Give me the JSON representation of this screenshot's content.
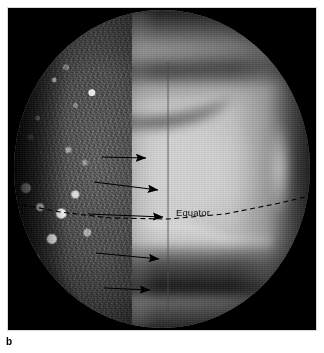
{
  "figure": {
    "panel_label": "b",
    "caption_text": "",
    "background_color": "#ffffff",
    "frame_color": "#000000"
  },
  "image": {
    "subject": "planetary-disk",
    "description": "Telescopic image of a banded planetary disk with a mottled terminator hemisphere at left and bright cloud zones at right",
    "annotations": {
      "equator_label": "Equator",
      "equator_line_style": "dashed",
      "meridian_line_style": "solid-thin",
      "arrow_count": 5,
      "arrow_color": "#000000"
    }
  },
  "arrows": [
    {
      "id": "arrow-1",
      "x1": 102,
      "y1": 157,
      "x2": 146,
      "y2": 158
    },
    {
      "id": "arrow-2",
      "x1": 94,
      "y1": 182,
      "x2": 158,
      "y2": 190
    },
    {
      "id": "arrow-3",
      "x1": 88,
      "y1": 214,
      "x2": 163,
      "y2": 217
    },
    {
      "id": "arrow-4",
      "x1": 96,
      "y1": 253,
      "x2": 159,
      "y2": 259
    },
    {
      "id": "arrow-5",
      "x1": 104,
      "y1": 288,
      "x2": 150,
      "y2": 290
    }
  ],
  "equator_curve": {
    "points": "14,203 60,212 110,218 168,219 225,214 280,203 305,197"
  },
  "meridian": {
    "x": 168,
    "y1": 62,
    "y2": 320
  },
  "equator_label_pos": {
    "x": 176,
    "y": 207
  },
  "colors": {
    "disk_bright": "#d4d4d4",
    "disk_mid": "#8f8f8f",
    "disk_dark": "#2a2a2a",
    "black": "#000000",
    "white": "#ffffff"
  }
}
